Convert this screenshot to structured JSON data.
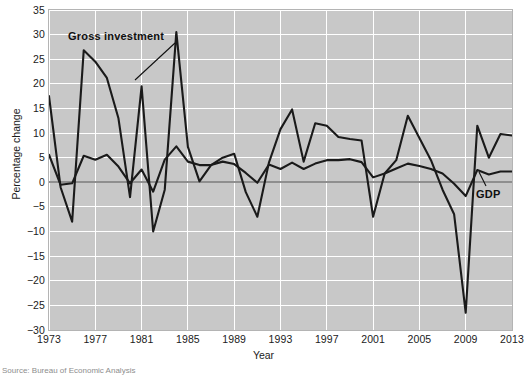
{
  "figure": {
    "source_note": "Source: Bureau of Economic Analysis"
  },
  "axes": {
    "ylabel": "Percentage change",
    "xlabel": "Year",
    "yticks": [
      "35",
      "30",
      "25",
      "20",
      "15",
      "10",
      "5",
      "0",
      "-5",
      "-10",
      "-15",
      "-20",
      "-25",
      "-30"
    ],
    "xticks": [
      "1973",
      "1977",
      "1981",
      "1985",
      "1989",
      "1993",
      "1997",
      "2001",
      "2005",
      "2009",
      "2013"
    ]
  },
  "annotations": {
    "gross_investment": "Gross investment",
    "gdp": "GDP"
  },
  "chart_data": {
    "type": "line",
    "title": "",
    "xlabel": "Year",
    "ylabel": "Percentage change",
    "xlim": [
      1973,
      2013
    ],
    "ylim": [
      -30,
      35
    ],
    "ytick_step": 5,
    "xtick_step": 4,
    "grid": true,
    "grid_color": "#ffffff",
    "plot_bgcolor": "#c8c8c8",
    "line_color": "#1a1a1a",
    "zero_line_color": "#8f8f8f",
    "legend": "annotated-inline",
    "x": [
      1973,
      1974,
      1975,
      1976,
      1977,
      1978,
      1979,
      1980,
      1981,
      1982,
      1983,
      1984,
      1985,
      1986,
      1987,
      1988,
      1989,
      1990,
      1991,
      1992,
      1993,
      1994,
      1995,
      1996,
      1997,
      1998,
      1999,
      2000,
      2001,
      2002,
      2003,
      2004,
      2005,
      2006,
      2007,
      2008,
      2009,
      2010,
      2011,
      2012,
      2013
    ],
    "series": [
      {
        "name": "Gross investment",
        "values": [
          17.5,
          -1.0,
          -8.0,
          26.8,
          24.5,
          21.2,
          13.0,
          -3.0,
          19.5,
          -10.0,
          -1.5,
          30.5,
          7.2,
          0.2,
          3.5,
          5.0,
          5.8,
          -2.0,
          -7.0,
          4.0,
          10.8,
          14.8,
          4.2,
          12.0,
          11.5,
          9.2,
          8.8,
          8.5,
          -7.0,
          1.8,
          4.5,
          13.5,
          9.0,
          4.5,
          -1.5,
          -6.5,
          -26.5,
          11.5,
          5.0,
          9.8,
          9.5
        ]
      },
      {
        "name": "GDP",
        "values": [
          5.6,
          -0.5,
          -0.2,
          5.4,
          4.6,
          5.6,
          3.2,
          -0.2,
          2.6,
          -1.9,
          4.6,
          7.3,
          4.2,
          3.5,
          3.5,
          4.2,
          3.7,
          1.9,
          -0.1,
          3.6,
          2.7,
          4.0,
          2.7,
          3.8,
          4.5,
          4.5,
          4.7,
          4.1,
          1.0,
          1.8,
          2.8,
          3.8,
          3.3,
          2.7,
          1.8,
          -0.3,
          -2.8,
          2.5,
          1.6,
          2.2,
          2.2
        ]
      }
    ]
  }
}
